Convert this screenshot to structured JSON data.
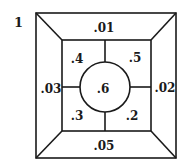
{
  "figure": {
    "number": "1"
  },
  "regions": {
    "top": ".01",
    "right": ".02",
    "left": ".03",
    "bottom": ".05",
    "inner_top_left": ".4",
    "inner_top_right": ".5",
    "inner_bottom_left": ".3",
    "inner_bottom_right": ".2",
    "center": ".6"
  },
  "colors": {
    "stroke": "#1a1a1a",
    "background": "#ffffff"
  }
}
